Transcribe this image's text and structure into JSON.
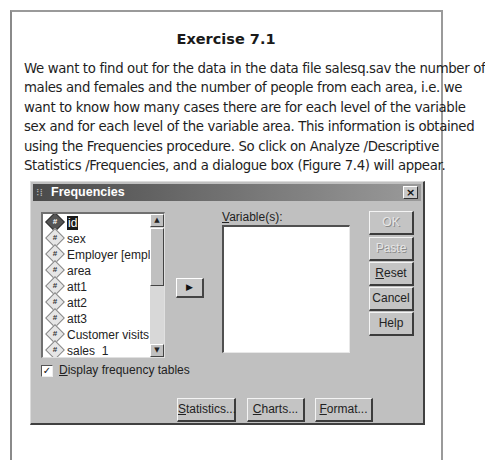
{
  "document": {
    "title": "Exercise 7.1",
    "paragraph_lines": [
      "We want to find out for the data in the data file salesq.sav the number of",
      "males and females and the number of people from each area, i.e. we",
      "want to know how many cases there are for each level of the variable",
      "sex and for each level of the variable area. This information is obtained",
      "using the Frequencies procedure. So click on Analyze /Descriptive",
      "Statistics /Frequencies, and a dialogue box (Figure 7.4) will appear."
    ]
  },
  "dialog": {
    "title": "Frequencies",
    "close_label": "×",
    "source_list": {
      "items": [
        {
          "label": "id",
          "selected": true
        },
        {
          "label": "sex",
          "selected": false
        },
        {
          "label": "Employer [empl]",
          "selected": false
        },
        {
          "label": "area",
          "selected": false
        },
        {
          "label": "att1",
          "selected": false
        },
        {
          "label": "att2",
          "selected": false
        },
        {
          "label": "att3",
          "selected": false
        },
        {
          "label": "Customer visits [cus",
          "selected": false
        },
        {
          "label": "sales_1",
          "selected": false
        }
      ],
      "variable_icon": "#"
    },
    "move_button_label": "▶",
    "variables_label": "Variable(s):",
    "variables_label_mnemonic": "V",
    "variables_label_rest": "ariable(s):",
    "buttons": {
      "ok": {
        "label": "OK",
        "enabled": false
      },
      "paste": {
        "label": "Paste",
        "enabled": false
      },
      "reset": {
        "mnemonic": "R",
        "rest": "eset",
        "enabled": true
      },
      "cancel": {
        "label": "Cancel",
        "enabled": true
      },
      "help": {
        "label": "Help",
        "enabled": true
      }
    },
    "display_frequency_tables": {
      "checked": true,
      "check_mark": "✓",
      "mnemonic": "D",
      "rest": "isplay frequency tables"
    },
    "bottom_buttons": {
      "statistics": {
        "mnemonic": "S",
        "rest": "tatistics..."
      },
      "charts": {
        "mnemonic": "C",
        "rest": "harts..."
      },
      "format": {
        "mnemonic": "F",
        "rest": "ormat..."
      }
    }
  }
}
